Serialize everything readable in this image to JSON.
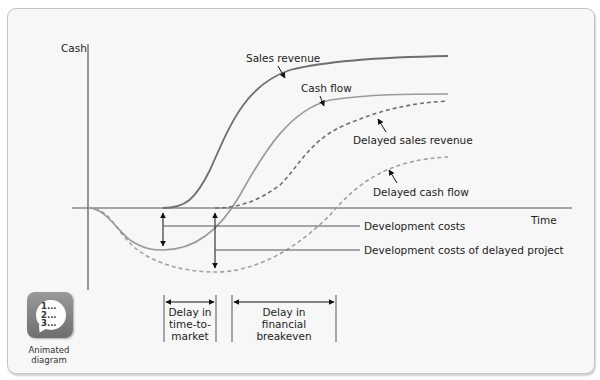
{
  "diagram": {
    "axes": {
      "y_label": "Cash",
      "x_label": "Time"
    },
    "curves": [
      {
        "id": "sales_revenue",
        "label": "Sales revenue",
        "style": "solid",
        "color": "#6f6f6f"
      },
      {
        "id": "cash_flow",
        "label": "Cash flow",
        "style": "solid",
        "color": "#9a9a9a"
      },
      {
        "id": "delayed_sales_revenue",
        "label": "Delayed sales revenue",
        "style": "dashed",
        "color": "#6f6f6f"
      },
      {
        "id": "delayed_cash_flow",
        "label": "Delayed cash flow",
        "style": "dashed",
        "color": "#9a9a9a"
      }
    ],
    "cost_labels": {
      "development_costs": "Development costs",
      "development_costs_delayed": "Development costs of delayed project"
    },
    "delays": {
      "time_to_market": [
        "Delay in",
        "time-to-",
        "market"
      ],
      "financial_breakeven": [
        "Delay in",
        "financial",
        "breakeven"
      ]
    },
    "colors": {
      "frame_background": "#f7f7f7",
      "axis": "#555555",
      "text": "#222222"
    }
  },
  "badge": {
    "icon_text": "1...\n2...\n3...",
    "caption_line1": "Animated",
    "caption_line2": "diagram"
  }
}
